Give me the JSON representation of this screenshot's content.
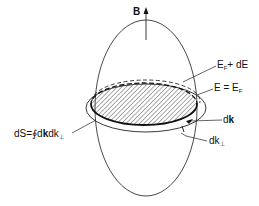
{
  "diagram": {
    "labels": {
      "field": "B",
      "upper_surface_main": "E",
      "upper_surface_sub": "F",
      "upper_surface_rest": "+ dE",
      "fermi_surface_main": "E = E",
      "fermi_surface_sub": "F",
      "dk_main": "d",
      "dk_bold": "k",
      "dkperp_main": "dk",
      "dkperp_sub": "⊥",
      "area_prefix": "dS=∮d",
      "area_bold": "k",
      "area_rest": "dk",
      "area_sub": "⊥"
    },
    "colors": {
      "stroke": "#222222",
      "hatch": "#555555",
      "background": "#ffffff"
    }
  }
}
